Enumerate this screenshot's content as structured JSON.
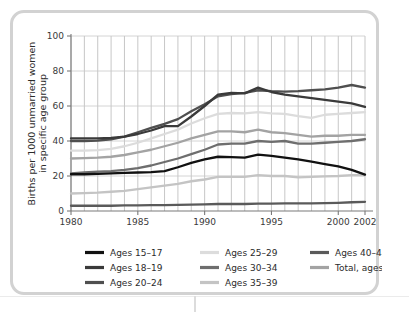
{
  "chart_data": {
    "type": "line",
    "title": "",
    "xlabel": "",
    "ylabel": "Births per 1000 unmarried women in specific age group",
    "ylabel_line1": "Births per 1000 unmarried women",
    "ylabel_line2": "in specific age group",
    "xlim": [
      1980,
      2002
    ],
    "ylim": [
      0,
      100
    ],
    "xticks": [
      1980,
      1985,
      1990,
      1995,
      2000,
      2002
    ],
    "xtick_labels": [
      "1980",
      "1985",
      "1990",
      "1995",
      "2000",
      "2002"
    ],
    "yticks": [
      0,
      20,
      40,
      60,
      80,
      100
    ],
    "ytick_labels": [
      "0",
      "20",
      "40",
      "60",
      "80",
      "100"
    ],
    "grid": "vertical gridlines every year, horizontal gridlines at each y tick",
    "legend_position": "below plot, three columns",
    "x": [
      1980,
      1981,
      1982,
      1983,
      1984,
      1985,
      1986,
      1987,
      1988,
      1989,
      1990,
      1991,
      1992,
      1993,
      1994,
      1995,
      1996,
      1997,
      1998,
      1999,
      2000,
      2001,
      2002
    ],
    "series": [
      {
        "name": "Ages 15–17",
        "color": "#111111",
        "values": [
          21,
          21,
          21.2,
          21.5,
          21.8,
          22,
          22.2,
          22.8,
          25,
          27.5,
          29.5,
          31,
          30.8,
          30.5,
          32.2,
          31.5,
          30.5,
          29.5,
          28.2,
          26.8,
          25.5,
          23.5,
          20.8
        ]
      },
      {
        "name": "Ages 18–19",
        "color": "#3a3a3a",
        "values": [
          41.5,
          41.5,
          41.5,
          41.8,
          42.5,
          44,
          46,
          48.5,
          48.5,
          54,
          60,
          66.5,
          67.5,
          67.2,
          70.5,
          68,
          66.5,
          65.5,
          64.5,
          63.5,
          62.5,
          61.5,
          59.5
        ]
      },
      {
        "name": "Ages 20–24",
        "color": "#4f4f4f",
        "values": [
          40,
          40,
          40.2,
          41,
          42.5,
          45,
          47.5,
          49.8,
          52.5,
          57,
          61,
          65.5,
          66.8,
          67.5,
          69,
          68.5,
          68.2,
          68.5,
          69,
          69.5,
          70.5,
          72,
          70.5
        ]
      },
      {
        "name": "Ages 25–29",
        "color": "#dcdcdc",
        "values": [
          34.5,
          34.5,
          34.8,
          35.5,
          37,
          39,
          41.5,
          44,
          46.5,
          50,
          53,
          55.5,
          56,
          55.8,
          56.5,
          55.8,
          55.5,
          54.2,
          53.2,
          55,
          55.5,
          56,
          56.5
        ]
      },
      {
        "name": "Ages 30–34",
        "color": "#6e6e6e",
        "values": [
          21.5,
          22,
          22.5,
          22.8,
          23.5,
          24.5,
          26,
          28,
          30,
          32.5,
          35,
          38,
          38.5,
          38.5,
          40,
          39.5,
          40,
          38.5,
          38.5,
          39,
          39.5,
          40,
          41
        ]
      },
      {
        "name": "Ages 35–39",
        "color": "#c4c4c4",
        "values": [
          10,
          10.2,
          10.5,
          11,
          11.5,
          12.5,
          13.5,
          14.5,
          15.5,
          17,
          18,
          19.5,
          19.5,
          19.5,
          20.5,
          20,
          20,
          19.2,
          19.5,
          19.8,
          20,
          20.5,
          20.5
        ]
      },
      {
        "name": "Ages 40–44",
        "color": "#5a5a5a",
        "values": [
          3,
          3,
          3,
          3,
          3.2,
          3.2,
          3.3,
          3.4,
          3.5,
          3.6,
          3.8,
          4,
          4,
          4,
          4.2,
          4.2,
          4.3,
          4.3,
          4.4,
          4.5,
          4.7,
          5,
          5.2
        ]
      },
      {
        "name": "Total, ages 15–44",
        "color": "#a3a3a3",
        "values": [
          30,
          30.2,
          30.5,
          31,
          32,
          33.5,
          35,
          37,
          39,
          41.5,
          43.5,
          45.5,
          45.5,
          45,
          46.5,
          45,
          44.5,
          43.5,
          42.5,
          43,
          43,
          43.5,
          43.5
        ]
      }
    ]
  },
  "legend": {
    "columns": [
      [
        {
          "label": "Ages 15–17",
          "color": "#111111"
        },
        {
          "label": "Ages 18–19",
          "color": "#3a3a3a"
        },
        {
          "label": "Ages 20–24",
          "color": "#4f4f4f"
        }
      ],
      [
        {
          "label": "Ages 25–29",
          "color": "#dcdcdc"
        },
        {
          "label": "Ages 30–34",
          "color": "#6e6e6e"
        },
        {
          "label": "Ages 35–39",
          "color": "#c4c4c4"
        }
      ],
      [
        {
          "label": "Ages 40–44",
          "color": "#5a5a5a"
        },
        {
          "label": "Total, ages 15–44",
          "color": "#a3a3a3"
        }
      ]
    ]
  }
}
